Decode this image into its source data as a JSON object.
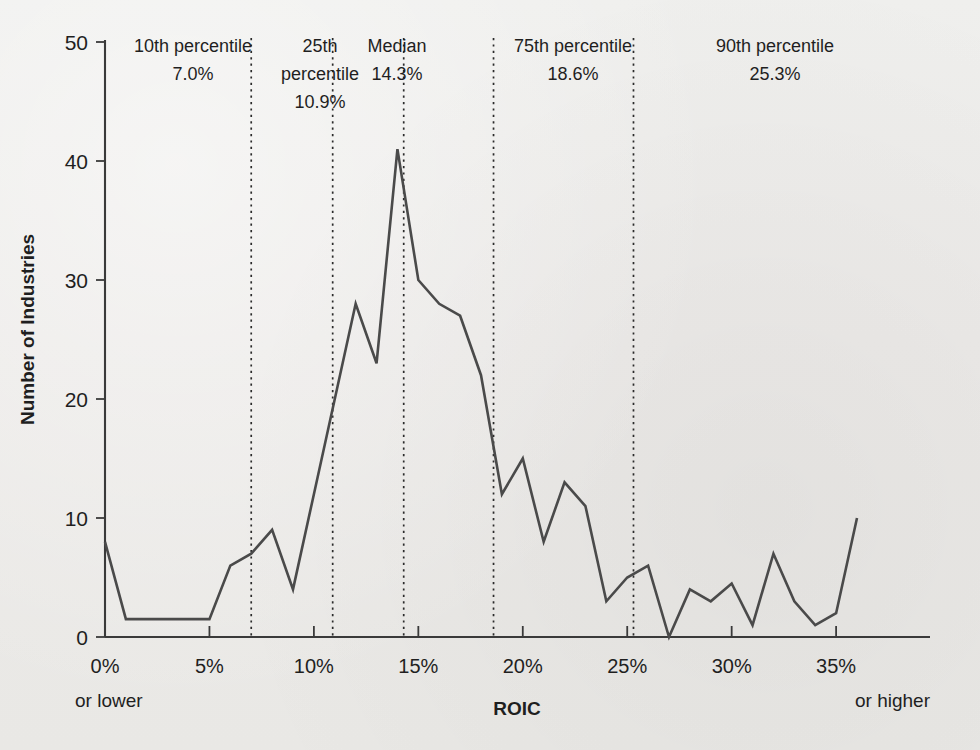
{
  "chart_data": {
    "type": "line",
    "title": "",
    "subtitle": "",
    "xlabel": "ROIC",
    "ylabel": "Number of Industries",
    "xlim": [
      0,
      36
    ],
    "ylim": [
      0,
      50
    ],
    "grid": false,
    "legend": "none",
    "x_tick_values": [
      0,
      5,
      10,
      15,
      20,
      25,
      30,
      35
    ],
    "x_tick_labels": [
      "0%",
      "5%",
      "10%",
      "15%",
      "20%",
      "25%",
      "30%",
      "35%"
    ],
    "y_tick_values": [
      0,
      10,
      20,
      30,
      40,
      50
    ],
    "y_tick_labels": [
      "0",
      "10",
      "20",
      "30",
      "40",
      "50"
    ],
    "x_axis_left_note": "or lower",
    "x_axis_right_note": "or higher",
    "x": [
      0,
      1,
      2,
      3,
      4,
      5,
      6,
      7,
      8,
      9,
      10,
      11,
      12,
      13,
      14,
      15,
      16,
      17,
      18,
      19,
      20,
      21,
      22,
      23,
      24,
      25,
      26,
      27,
      28,
      29,
      30,
      31,
      32,
      33,
      34,
      35,
      36
    ],
    "values": [
      8,
      1.5,
      1.5,
      1.5,
      1.5,
      1.5,
      6,
      7,
      9,
      4,
      12,
      20,
      28,
      23,
      41,
      30,
      28,
      27,
      22,
      12,
      15,
      8,
      13,
      11,
      3,
      5,
      6,
      0,
      4,
      3,
      4.5,
      1,
      7,
      3,
      1,
      2,
      10
    ],
    "series": [
      {
        "name": "Number of Industries",
        "values": [
          8,
          1.5,
          1.5,
          1.5,
          1.5,
          1.5,
          6,
          7,
          9,
          4,
          12,
          20,
          28,
          23,
          41,
          30,
          28,
          27,
          22,
          12,
          15,
          8,
          13,
          11,
          3,
          5,
          6,
          0,
          4,
          3,
          4.5,
          1,
          7,
          3,
          1,
          2,
          10
        ]
      }
    ],
    "annotations": [
      {
        "name": "10th percentile",
        "label": "10th percentile",
        "value_label": "7.0%",
        "x": 7.0
      },
      {
        "name": "25th percentile",
        "label": "25th percentile",
        "value_label": "10.9%",
        "x": 10.9
      },
      {
        "name": "Median",
        "label": "Median",
        "value_label": "14.3%",
        "x": 14.3
      },
      {
        "name": "75th percentile",
        "label": "75th percentile",
        "value_label": "18.6%",
        "x": 18.6
      },
      {
        "name": "90th percentile",
        "label": "90th percentile",
        "value_label": "25.3%",
        "x": 25.3
      }
    ],
    "colors": {
      "background": "#ececea",
      "line": "#4a4a4a",
      "axis": "#3a3a3a",
      "percentile_line": "#2b2b2b",
      "text": "#1f1f1f"
    }
  },
  "annotation_blocks": [
    {
      "line1": "10th percentile",
      "line2": "7.0%",
      "line3": "",
      "center_x": 193
    },
    {
      "line1": "25th",
      "line2": "percentile",
      "line3": "10.9%",
      "center_x": 320
    },
    {
      "line1": "Median",
      "line2": "14.3%",
      "line3": "",
      "center_x": 397
    },
    {
      "line1": "75th percentile",
      "line2": "18.6%",
      "line3": "",
      "center_x": 573
    },
    {
      "line1": "90th percentile",
      "line2": "25.3%",
      "line3": "",
      "center_x": 775
    }
  ],
  "axis": {
    "y_title": "Number of Industries",
    "x_title": "ROIC",
    "left_note": "or lower",
    "right_note": "or higher"
  }
}
